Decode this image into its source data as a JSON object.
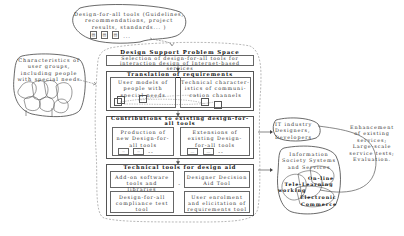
{
  "cloud_top": {
    "text": "Design-for-all tools (Guidelines, recommendations, project results, standards...)",
    "line1": "Design-for-all tools (Guidelines,",
    "line2": "recommendations, project",
    "line3": "results, standards... )",
    "doc_icons": [
      "document-icon",
      "document-icon",
      "document-icon"
    ],
    "ellipsis": "..."
  },
  "cloud_left": {
    "line1": "Characteristics of",
    "line2": "user groups,",
    "line3": "including people",
    "line4": "with special needs"
  },
  "problem_space": {
    "title": "Design Support Problem Space",
    "selection_line1": "Selection of design-for-all tools for",
    "selection_line2": "interaction design of Internet-based services",
    "translation": {
      "title": "Translation of requirements",
      "left_line1": "User models of",
      "left_line2": "people with",
      "left_line3": "special needs",
      "right_line1": "Technical character-",
      "right_line2": "istics of communi-",
      "right_line3": "cation channels"
    },
    "contributions": {
      "title_line1": "Contributions to existing design-for-",
      "title_line2": "all tools",
      "left_line1": "Production of",
      "left_line2": "new Design-for-",
      "left_line3": "all tools",
      "right_line1": "Extensions of",
      "right_line2": "existing Design-",
      "right_line3": "for-all tools",
      "mini_left": [
        "--",
        "--"
      ],
      "mini_right": [
        "...",
        "..."
      ],
      "dash": "--"
    },
    "technical": {
      "title": "Technical tools for design aid",
      "tool1_line1": "Add-on software",
      "tool1_line2": "tools and libraries",
      "tool2_line1": "Designer Decision",
      "tool2_line2": "Aid Tool",
      "tool3_line1": "Design-for-all",
      "tool3_line2": "compliance test",
      "tool3_line3": "tool",
      "tool4_line1": "User enrolment",
      "tool4_line2": "and elicitation of",
      "tool4_line3": "requirements tool",
      "dash": "-"
    }
  },
  "it_industry": {
    "line1": "IT industry",
    "line2": "Designers,",
    "line3": "Developers"
  },
  "enhancement": {
    "line1": "Enhancement",
    "line2": "of existing",
    "line3": "services;",
    "line4": "Large-scale",
    "line5": "service tests;",
    "line6": "Evaluation."
  },
  "info_society": {
    "line1": "Information",
    "line2": "Society Systems",
    "line3": "and Services",
    "online": "On-line",
    "tele_learning": "Tele-Learning",
    "working": "working",
    "electronic": "Electronic",
    "commerce": "Commerce"
  },
  "colors": {
    "line": "#555555",
    "dashed": "#888888",
    "background": "#ffffff"
  }
}
